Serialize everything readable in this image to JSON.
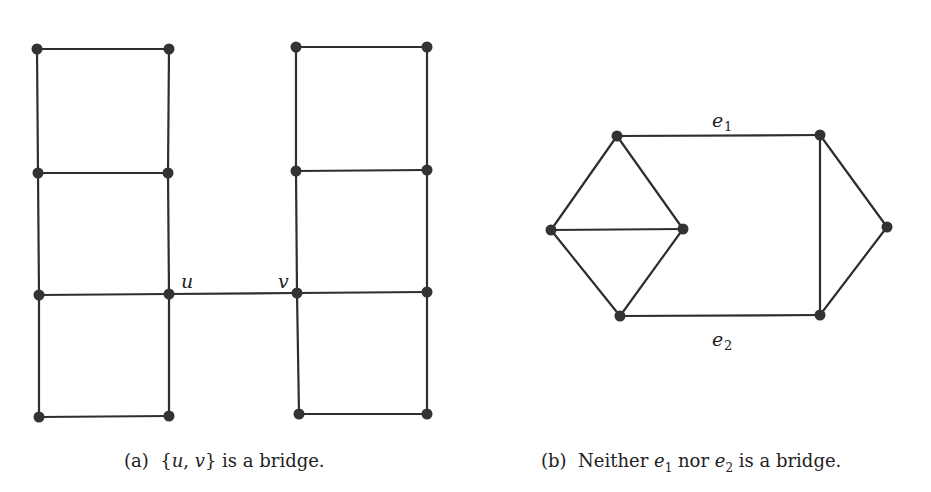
{
  "figure_a": {
    "caption_prefix": "(a)",
    "caption_set_open": "{",
    "caption_u": "u",
    "caption_comma": ", ",
    "caption_v": "v",
    "caption_set_close": "}",
    "caption_suffix": " is a bridge.",
    "labels": {
      "u": "u",
      "v": "v"
    },
    "nodes": [
      {
        "id": "a1",
        "x": 37,
        "y": 49
      },
      {
        "id": "a2",
        "x": 169,
        "y": 49
      },
      {
        "id": "a3",
        "x": 38,
        "y": 173
      },
      {
        "id": "a4",
        "x": 168,
        "y": 173
      },
      {
        "id": "a5",
        "x": 39,
        "y": 295
      },
      {
        "id": "u",
        "x": 169,
        "y": 294
      },
      {
        "id": "a7",
        "x": 39,
        "y": 417
      },
      {
        "id": "a8",
        "x": 169,
        "y": 416
      },
      {
        "id": "b1",
        "x": 296,
        "y": 47
      },
      {
        "id": "b2",
        "x": 427,
        "y": 47
      },
      {
        "id": "b3",
        "x": 296,
        "y": 171
      },
      {
        "id": "b4",
        "x": 427,
        "y": 170
      },
      {
        "id": "v",
        "x": 297,
        "y": 293
      },
      {
        "id": "b6",
        "x": 427,
        "y": 292
      },
      {
        "id": "b7",
        "x": 299,
        "y": 414
      },
      {
        "id": "b8",
        "x": 427,
        "y": 414
      }
    ],
    "edges": [
      [
        "a1",
        "a2"
      ],
      [
        "a1",
        "a3"
      ],
      [
        "a2",
        "a4"
      ],
      [
        "a3",
        "a4"
      ],
      [
        "a3",
        "a5"
      ],
      [
        "a4",
        "u"
      ],
      [
        "a5",
        "u"
      ],
      [
        "a5",
        "a7"
      ],
      [
        "u",
        "a8"
      ],
      [
        "a7",
        "a8"
      ],
      [
        "b1",
        "b2"
      ],
      [
        "b1",
        "b3"
      ],
      [
        "b2",
        "b4"
      ],
      [
        "b3",
        "b4"
      ],
      [
        "b3",
        "v"
      ],
      [
        "b4",
        "b6"
      ],
      [
        "v",
        "b6"
      ],
      [
        "v",
        "b7"
      ],
      [
        "b6",
        "b8"
      ],
      [
        "b7",
        "b8"
      ],
      [
        "u",
        "v"
      ]
    ]
  },
  "figure_b": {
    "caption_prefix": "(b)",
    "caption_word1": "Neither ",
    "caption_e": "e",
    "caption_sub1": "1",
    "caption_word2": " nor ",
    "caption_sub2": "2",
    "caption_suffix": " is a bridge.",
    "labels": {
      "e1_base": "e",
      "e1_sub": "1",
      "e2_base": "e",
      "e2_sub": "2"
    },
    "nodes": [
      {
        "id": "top-left",
        "x": 617,
        "y": 136
      },
      {
        "id": "top-right",
        "x": 820,
        "y": 135
      },
      {
        "id": "left",
        "x": 551,
        "y": 230
      },
      {
        "id": "mid",
        "x": 683,
        "y": 229
      },
      {
        "id": "right",
        "x": 887,
        "y": 227
      },
      {
        "id": "bottom-left",
        "x": 620,
        "y": 316
      },
      {
        "id": "bottom-right",
        "x": 820,
        "y": 315
      }
    ],
    "edges": [
      [
        "top-left",
        "top-right"
      ],
      [
        "top-left",
        "left"
      ],
      [
        "top-left",
        "mid"
      ],
      [
        "left",
        "mid"
      ],
      [
        "left",
        "bottom-left"
      ],
      [
        "mid",
        "bottom-left"
      ],
      [
        "bottom-left",
        "bottom-right"
      ],
      [
        "top-right",
        "bottom-right"
      ],
      [
        "top-right",
        "right"
      ],
      [
        "right",
        "bottom-right"
      ]
    ]
  }
}
